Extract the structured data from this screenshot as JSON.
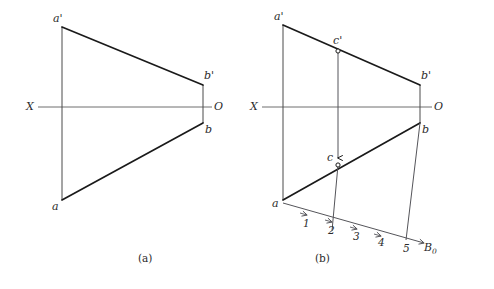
{
  "figure": {
    "title": "",
    "stroke_color": "#1a1a1a",
    "axis_color": "#6e6e6e",
    "thin_color": "#55555a",
    "background": "#ffffff"
  },
  "panel_a": {
    "caption": "(a)",
    "axis_label_left": "X",
    "axis_label_right": "O",
    "points": {
      "a_prime": {
        "label": "a'",
        "x": 62,
        "y": 27
      },
      "b_prime": {
        "label": "b'",
        "x": 203,
        "y": 85
      },
      "b": {
        "label": "b",
        "x": 203,
        "y": 123
      },
      "a": {
        "label": "a",
        "x": 62,
        "y": 200
      }
    },
    "axis": {
      "x1": 38,
      "y1": 107,
      "x2": 212,
      "y2": 107
    }
  },
  "panel_b": {
    "caption": "(b)",
    "axis_label_left": "X",
    "axis_label_right": "O",
    "baseline_label": "B",
    "baseline_label_sub": "0",
    "points": {
      "a_prime": {
        "label": "a'",
        "x": 283,
        "y": 25
      },
      "c_prime": {
        "label": "c'",
        "x": 338,
        "y": 51
      },
      "b_prime": {
        "label": "b'",
        "x": 420,
        "y": 85
      },
      "b": {
        "label": "b",
        "x": 420,
        "y": 123
      },
      "c": {
        "label": "c",
        "x": 338,
        "y": 165
      },
      "a": {
        "label": "a",
        "x": 283,
        "y": 200
      }
    },
    "axis": {
      "x1": 262,
      "y1": 107,
      "x2": 432,
      "y2": 107
    },
    "scale_ticks": [
      {
        "label": "1",
        "x": 307,
        "y": 223
      },
      {
        "label": "2",
        "x": 331,
        "y": 230
      },
      {
        "label": "3",
        "x": 356,
        "y": 236
      },
      {
        "label": "4",
        "x": 381,
        "y": 242
      },
      {
        "label": "5",
        "x": 406,
        "y": 248
      }
    ]
  }
}
